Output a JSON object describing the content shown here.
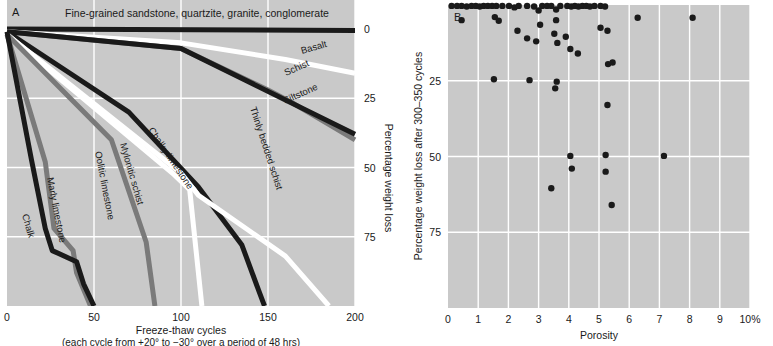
{
  "figure": {
    "background_color": "#c9c9c9",
    "gridline_color": "#ffffff",
    "ink_color": "#1a1a1a"
  },
  "panelA": {
    "label": "A",
    "top_label": "Fine-grained sandstone, quartzite, granite, conglomerate",
    "x_axis": {
      "title": "Freeze-thaw cycles",
      "subtitle": "(each cycle from +20° to −30° over a period of 48 hrs)",
      "ticks": [
        "0",
        "50",
        "100",
        "150",
        "200"
      ],
      "tick_values": [
        0,
        50,
        100,
        150,
        200
      ],
      "range": [
        0,
        200
      ]
    },
    "y_axis": {
      "title": "Percentage weight loss",
      "ticks": [
        "0",
        "25",
        "50",
        "75"
      ],
      "tick_values": [
        0,
        25,
        50,
        75
      ],
      "range": [
        0,
        100
      ],
      "side": "right"
    },
    "chart_data": {
      "type": "line",
      "title": "Freeze-thaw durability of rock types",
      "xlabel": "Freeze-thaw cycles",
      "ylabel": "Percentage weight loss",
      "xlim": [
        0,
        200
      ],
      "ylim": [
        0,
        100
      ],
      "y_inverted": true,
      "grid": true,
      "series": [
        {
          "name": "Fine-grained sandstone, quartzite, granite, conglomerate",
          "color": "#1a1a1a",
          "width": 5,
          "points": [
            [
              0,
              0
            ],
            [
              200,
              0.5
            ]
          ]
        },
        {
          "name": "Basalt",
          "color": "#ffffff",
          "width": 5,
          "points": [
            [
              0,
              1
            ],
            [
              100,
              5
            ],
            [
              160,
              11
            ],
            [
              200,
              16
            ]
          ]
        },
        {
          "name": "Schist",
          "color": "#7a7a7a",
          "width": 5,
          "points": [
            [
              0,
              1
            ],
            [
              100,
              7
            ],
            [
              150,
              22
            ],
            [
              165,
              27
            ],
            [
              200,
              40
            ]
          ]
        },
        {
          "name": "Siltstone",
          "color": "#1a1a1a",
          "width": 5,
          "points": [
            [
              0,
              1
            ],
            [
              100,
              7
            ],
            [
              200,
              38
            ]
          ]
        },
        {
          "name": "Chalky limestone",
          "color": "#1a1a1a",
          "width": 5,
          "points": [
            [
              0,
              1
            ],
            [
              70,
              30
            ],
            [
              110,
              57
            ],
            [
              135,
              78
            ],
            [
              145,
              95
            ],
            [
              148,
              100
            ]
          ]
        },
        {
          "name": "Thinly bedded schist",
          "color": "#ffffff",
          "width": 5,
          "points": [
            [
              0,
              2
            ],
            [
              100,
              52
            ],
            [
              110,
              60
            ],
            [
              160,
              82
            ],
            [
              185,
              100
            ]
          ]
        },
        {
          "name": "Mylonitic schist",
          "color": "#ffffff",
          "width": 5,
          "points": [
            [
              0,
              2
            ],
            [
              95,
              52
            ],
            [
              105,
              58
            ],
            [
              112,
              100
            ]
          ]
        },
        {
          "name": "Oolitic limestone",
          "color": "#7a7a7a",
          "width": 5,
          "points": [
            [
              0,
              2
            ],
            [
              60,
              40
            ],
            [
              80,
              77
            ],
            [
              85,
              100
            ]
          ]
        },
        {
          "name": "Marly limestone",
          "color": "#7a7a7a",
          "width": 5,
          "points": [
            [
              0,
              2
            ],
            [
              22,
              48
            ],
            [
              27,
              72
            ],
            [
              38,
              80
            ],
            [
              40,
              88
            ],
            [
              48,
              100
            ]
          ]
        },
        {
          "name": "Chalk",
          "color": "#1a1a1a",
          "width": 5,
          "points": [
            [
              0,
              1
            ],
            [
              14,
              47
            ],
            [
              22,
              72
            ],
            [
              26,
              80
            ],
            [
              40,
              84
            ],
            [
              44,
              92
            ],
            [
              50,
              100
            ]
          ]
        }
      ],
      "curve_labels": [
        {
          "text": "Basalt",
          "x": 302,
          "y": 54,
          "rot": -16
        },
        {
          "text": "Schist",
          "x": 286,
          "y": 76,
          "rot": -24
        },
        {
          "text": "Siltstone",
          "x": 285,
          "y": 104,
          "rot": -24
        },
        {
          "text": "Thinly bedded schist",
          "x": 250,
          "y": 108,
          "rot": 72
        },
        {
          "text": "Chalky limestone",
          "x": 148,
          "y": 130,
          "rot": 56
        },
        {
          "text": "Mylonitic schist",
          "x": 120,
          "y": 144,
          "rot": 74
        },
        {
          "text": "Oolitic limestone",
          "x": 95,
          "y": 152,
          "rot": 79
        },
        {
          "text": "Marly limestone",
          "x": 47,
          "y": 178,
          "rot": 79
        },
        {
          "text": "Chalk",
          "x": 22,
          "y": 215,
          "rot": 74
        }
      ]
    }
  },
  "panelB": {
    "label": "B",
    "x_axis": {
      "title": "Porosity",
      "ticks": [
        "0",
        "1",
        "2",
        "3",
        "4",
        "5",
        "6",
        "7",
        "8",
        "9",
        "10%"
      ],
      "tick_values": [
        0,
        1,
        2,
        3,
        4,
        5,
        6,
        7,
        8,
        9,
        10
      ],
      "range": [
        0,
        10
      ]
    },
    "y_axis": {
      "title": "Percentage weight loss after 300–350 cycles",
      "ticks": [
        "25",
        "50",
        "75"
      ],
      "tick_values": [
        25,
        50,
        75
      ],
      "range": [
        0,
        100
      ],
      "side": "left"
    },
    "chart_data": {
      "type": "scatter",
      "title": "Porosity versus weight loss after 300–350 cycles",
      "xlabel": "Porosity",
      "ylabel": "Percentage weight loss after 300–350 cycles",
      "xlim": [
        0,
        10
      ],
      "ylim": [
        0,
        100
      ],
      "y_inverted": true,
      "grid": true,
      "marker_color": "#1a1a1a",
      "marker_size": 3.2,
      "points": [
        [
          0.12,
          0.3
        ],
        [
          0.3,
          0.3
        ],
        [
          0.45,
          0.3
        ],
        [
          0.62,
          0.5
        ],
        [
          0.78,
          0.3
        ],
        [
          0.92,
          0.3
        ],
        [
          1.05,
          0.5
        ],
        [
          1.18,
          0.3
        ],
        [
          1.32,
          0.3
        ],
        [
          1.46,
          0.3
        ],
        [
          1.6,
          0.3
        ],
        [
          1.8,
          0.3
        ],
        [
          2.02,
          0.3
        ],
        [
          2.2,
          0.8
        ],
        [
          2.34,
          0.3
        ],
        [
          2.62,
          0.3
        ],
        [
          2.85,
          0.5
        ],
        [
          3.0,
          1.8
        ],
        [
          3.12,
          0.3
        ],
        [
          3.28,
          0.3
        ],
        [
          3.42,
          0.3
        ],
        [
          3.58,
          1.5
        ],
        [
          3.72,
          0.3
        ],
        [
          3.95,
          0.3
        ],
        [
          4.08,
          0.5
        ],
        [
          4.2,
          0.3
        ],
        [
          4.32,
          0.5
        ],
        [
          4.45,
          0.3
        ],
        [
          4.58,
          0.3
        ],
        [
          4.7,
          0.5
        ],
        [
          4.85,
          0.3
        ],
        [
          5.05,
          0.3
        ],
        [
          5.2,
          0.5
        ],
        [
          0.45,
          5.0
        ],
        [
          1.55,
          4.0
        ],
        [
          1.68,
          5.2
        ],
        [
          2.3,
          8.5
        ],
        [
          2.62,
          11.0
        ],
        [
          2.92,
          12.0
        ],
        [
          3.05,
          6.5
        ],
        [
          3.52,
          9.5
        ],
        [
          3.58,
          5.0
        ],
        [
          3.62,
          12.5
        ],
        [
          3.9,
          10.5
        ],
        [
          4.05,
          14.5
        ],
        [
          4.3,
          16.0
        ],
        [
          5.05,
          7.5
        ],
        [
          5.28,
          8.5
        ],
        [
          6.28,
          4.2
        ],
        [
          8.1,
          4.2
        ],
        [
          1.52,
          24.5
        ],
        [
          2.7,
          24.8
        ],
        [
          3.6,
          25.3
        ],
        [
          3.55,
          27.5
        ],
        [
          5.3,
          19.5
        ],
        [
          5.45,
          19.0
        ],
        [
          5.28,
          33.0
        ],
        [
          5.22,
          49.5
        ],
        [
          4.05,
          49.8
        ],
        [
          7.15,
          49.8
        ],
        [
          4.1,
          54.0
        ],
        [
          5.22,
          55.0
        ],
        [
          3.42,
          60.5
        ],
        [
          5.42,
          66.0
        ]
      ]
    }
  }
}
